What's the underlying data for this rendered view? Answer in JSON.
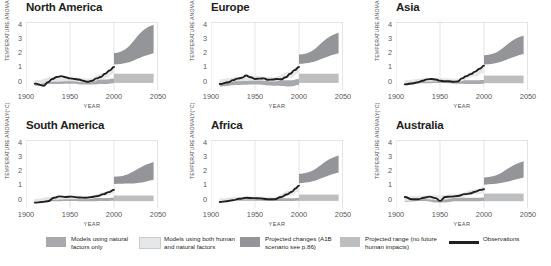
{
  "figure": {
    "ylabel": "TEMPERATURE ANOMALY(°C)",
    "xlabel": "YEAR",
    "yticks": [
      "4",
      "3",
      "2",
      "1",
      "0"
    ],
    "xticks": [
      "1900",
      "1950",
      "2000",
      "2050"
    ]
  },
  "colors": {
    "natural_band": "#a7a9ac",
    "human_natural_band": "#e6e7e8",
    "projected_changes": "#939598",
    "projected_range": "#bcbec0",
    "observations": "#231f20",
    "axis": "#d9d9d9",
    "tick_text": "#58595b"
  },
  "legend": {
    "items": [
      {
        "name": "natural-only",
        "type": "swatch",
        "color": "#a7a9ac",
        "label": "Models using natural factors only"
      },
      {
        "name": "human-and-natural",
        "type": "swatch",
        "color": "#e6e7e8",
        "label": "Models using both human and natural factors"
      },
      {
        "name": "projected-changes",
        "type": "swatch",
        "color": "#939598",
        "label": "Projected changes (A1B scenario see p.86)"
      },
      {
        "name": "projected-range",
        "type": "swatch",
        "color": "#bcbec0",
        "label": "Projected range (no future human impacts)"
      },
      {
        "name": "observations",
        "type": "line",
        "color": "#231f20",
        "label": "Observations"
      }
    ]
  },
  "chart_data": {
    "type": "line",
    "xlabel": "YEAR",
    "ylabel": "TEMPERATURE ANOMALY(°C)",
    "xlim": [
      1900,
      2050
    ],
    "ylim": [
      -0.6,
      4.2
    ],
    "grid": false,
    "legend_position": "bottom",
    "panels": [
      {
        "name": "north-america",
        "title": "North America",
        "observations": {
          "x": [
            1910,
            1920,
            1925,
            1930,
            1935,
            1940,
            1945,
            1950,
            1955,
            1960,
            1965,
            1970,
            1975,
            1980,
            1985,
            1990,
            1995,
            2000
          ],
          "y": [
            -0.15,
            -0.3,
            -0.05,
            0.18,
            0.32,
            0.38,
            0.3,
            0.22,
            0.18,
            0.14,
            0.05,
            -0.02,
            0.05,
            0.22,
            0.32,
            0.55,
            0.78,
            1.02
          ]
        },
        "human_natural_band": {
          "x": [
            1910,
            1930,
            1950,
            1970,
            1990,
            2000
          ],
          "lower": [
            -0.22,
            -0.02,
            0.02,
            -0.08,
            0.22,
            0.55
          ],
          "upper": [
            0.08,
            0.3,
            0.32,
            0.22,
            0.62,
            1.05
          ]
        },
        "natural_band": {
          "x": [
            1910,
            1930,
            1950,
            1970,
            1990,
            2000
          ],
          "lower": [
            -0.3,
            -0.18,
            -0.15,
            -0.22,
            -0.18,
            -0.12
          ],
          "upper": [
            0.05,
            0.18,
            0.18,
            0.1,
            0.15,
            0.22
          ]
        },
        "projected_changes": {
          "x": [
            2000,
            2045
          ],
          "lower": [
            1.2,
            2.0
          ],
          "upper": [
            2.0,
            4.0
          ]
        },
        "projected_range": {
          "x": [
            2000,
            2045
          ],
          "lower": [
            -0.1,
            -0.1
          ],
          "upper": [
            0.55,
            0.55
          ]
        }
      },
      {
        "name": "europe",
        "title": "Europe",
        "observations": {
          "x": [
            1910,
            1920,
            1925,
            1930,
            1935,
            1940,
            1945,
            1950,
            1955,
            1960,
            1965,
            1970,
            1975,
            1980,
            1985,
            1990,
            1995,
            2000
          ],
          "y": [
            -0.18,
            -0.05,
            0.1,
            0.2,
            0.26,
            0.42,
            0.3,
            0.18,
            0.2,
            0.22,
            0.12,
            0.14,
            0.18,
            0.16,
            0.3,
            0.55,
            0.8,
            1.02
          ]
        },
        "human_natural_band": {
          "x": [
            1910,
            1930,
            1950,
            1970,
            1990,
            2000
          ],
          "lower": [
            -0.15,
            0.02,
            0.05,
            0.0,
            0.25,
            0.58
          ],
          "upper": [
            0.18,
            0.32,
            0.38,
            0.3,
            0.68,
            1.08
          ]
        },
        "natural_band": {
          "x": [
            1910,
            1930,
            1950,
            1970,
            1990,
            2000
          ],
          "lower": [
            -0.35,
            -0.25,
            -0.22,
            -0.3,
            -0.35,
            -0.25
          ],
          "upper": [
            0.05,
            0.18,
            0.2,
            0.12,
            0.08,
            0.18
          ]
        },
        "projected_changes": {
          "x": [
            2000,
            2045
          ],
          "lower": [
            1.25,
            2.0
          ],
          "upper": [
            1.9,
            3.45
          ]
        },
        "projected_range": {
          "x": [
            2000,
            2045
          ],
          "lower": [
            -0.1,
            -0.1
          ],
          "upper": [
            0.55,
            0.55
          ]
        }
      },
      {
        "name": "asia",
        "title": "Asia",
        "observations": {
          "x": [
            1910,
            1920,
            1925,
            1930,
            1935,
            1940,
            1945,
            1950,
            1955,
            1960,
            1965,
            1970,
            1975,
            1980,
            1985,
            1990,
            1995,
            2000
          ],
          "y": [
            -0.2,
            -0.12,
            -0.05,
            0.05,
            0.15,
            0.18,
            0.14,
            0.05,
            0.02,
            0.02,
            -0.02,
            0.0,
            0.22,
            0.38,
            0.52,
            0.7,
            0.9,
            1.12
          ]
        },
        "human_natural_band": {
          "x": [
            1910,
            1930,
            1950,
            1970,
            1990,
            2000
          ],
          "lower": [
            -0.18,
            -0.02,
            0.0,
            -0.02,
            0.35,
            0.62
          ],
          "upper": [
            0.1,
            0.22,
            0.25,
            0.2,
            0.75,
            1.15
          ]
        },
        "natural_band": {
          "x": [
            1910,
            1930,
            1950,
            1970,
            1990,
            2000
          ],
          "lower": [
            -0.25,
            -0.12,
            -0.1,
            -0.15,
            -0.18,
            -0.15
          ],
          "upper": [
            0.02,
            0.12,
            0.12,
            0.08,
            0.08,
            0.1
          ]
        },
        "projected_changes": {
          "x": [
            2000,
            2045
          ],
          "lower": [
            1.2,
            1.95
          ],
          "upper": [
            1.85,
            3.25
          ]
        },
        "projected_range": {
          "x": [
            2000,
            2045
          ],
          "lower": [
            -0.12,
            -0.12
          ],
          "upper": [
            0.42,
            0.42
          ]
        }
      },
      {
        "name": "south-america",
        "title": "South America",
        "observations": {
          "x": [
            1910,
            1918,
            1925,
            1932,
            1938,
            1945,
            1952,
            1960,
            1968,
            1975,
            1982,
            1988,
            1994,
            2000
          ],
          "y": [
            -0.22,
            -0.18,
            -0.12,
            0.12,
            0.22,
            0.18,
            0.2,
            0.14,
            0.12,
            0.18,
            0.25,
            0.38,
            0.52,
            0.68
          ]
        },
        "human_natural_band": {
          "x": [
            1910,
            1930,
            1950,
            1970,
            1990,
            2000
          ],
          "lower": [
            -0.2,
            -0.02,
            0.02,
            0.02,
            0.25,
            0.42
          ],
          "upper": [
            0.05,
            0.22,
            0.28,
            0.25,
            0.52,
            0.75
          ]
        },
        "natural_band": {
          "x": [
            1910,
            1930,
            1950,
            1970,
            1990,
            2000
          ],
          "lower": [
            -0.22,
            -0.12,
            -0.1,
            -0.12,
            -0.1,
            -0.08
          ],
          "upper": [
            0.02,
            0.1,
            0.12,
            0.1,
            0.1,
            0.12
          ]
        },
        "projected_changes": {
          "x": [
            2000,
            2045
          ],
          "lower": [
            1.1,
            1.4
          ],
          "upper": [
            1.6,
            2.65
          ]
        },
        "projected_range": {
          "x": [
            2000,
            2045
          ],
          "lower": [
            -0.12,
            -0.12
          ],
          "upper": [
            0.28,
            0.28
          ]
        }
      },
      {
        "name": "africa",
        "title": "Africa",
        "observations": {
          "x": [
            1910,
            1918,
            1925,
            1932,
            1940,
            1948,
            1956,
            1964,
            1972,
            1980,
            1986,
            1992,
            1996,
            2000
          ],
          "y": [
            -0.18,
            -0.12,
            -0.05,
            0.05,
            0.12,
            0.1,
            0.08,
            0.02,
            0.02,
            0.18,
            0.35,
            0.55,
            0.78,
            0.98
          ]
        },
        "human_natural_band": {
          "x": [
            1910,
            1930,
            1950,
            1970,
            1990,
            2000
          ],
          "lower": [
            -0.15,
            0.0,
            0.02,
            0.0,
            0.3,
            0.55
          ],
          "upper": [
            0.08,
            0.2,
            0.22,
            0.18,
            0.62,
            1.0
          ]
        },
        "natural_band": {
          "x": [
            1910,
            1930,
            1950,
            1970,
            1990,
            2000
          ],
          "lower": [
            -0.18,
            -0.08,
            -0.08,
            -0.1,
            -0.1,
            -0.08
          ],
          "upper": [
            0.02,
            0.1,
            0.1,
            0.08,
            0.08,
            0.1
          ]
        },
        "projected_changes": {
          "x": [
            2000,
            2045
          ],
          "lower": [
            1.15,
            1.9
          ],
          "upper": [
            1.8,
            3.1
          ]
        },
        "projected_range": {
          "x": [
            2000,
            2045
          ],
          "lower": [
            -0.1,
            -0.1
          ],
          "upper": [
            0.35,
            0.35
          ]
        }
      },
      {
        "name": "australia",
        "title": "Australia",
        "observations": {
          "x": [
            1910,
            1918,
            1925,
            1932,
            1938,
            1945,
            1950,
            1956,
            1962,
            1970,
            1978,
            1984,
            1990,
            1996,
            2000
          ],
          "y": [
            0.18,
            0.02,
            0.02,
            0.12,
            0.2,
            0.1,
            -0.1,
            0.18,
            0.2,
            0.25,
            0.38,
            0.42,
            0.55,
            0.68,
            0.72
          ]
        },
        "human_natural_band": {
          "x": [
            1910,
            1930,
            1950,
            1970,
            1990,
            2000
          ],
          "lower": [
            -0.1,
            0.02,
            -0.05,
            0.1,
            0.35,
            0.45
          ],
          "upper": [
            0.22,
            0.28,
            0.3,
            0.4,
            0.72,
            0.88
          ]
        },
        "natural_band": {
          "x": [
            1910,
            1930,
            1950,
            1970,
            1990,
            2000
          ],
          "lower": [
            -0.15,
            -0.1,
            -0.22,
            -0.12,
            -0.12,
            -0.1
          ],
          "upper": [
            0.1,
            0.15,
            0.1,
            0.15,
            0.12,
            0.15
          ]
        },
        "projected_changes": {
          "x": [
            2000,
            2045
          ],
          "lower": [
            1.05,
            1.55
          ],
          "upper": [
            1.55,
            2.7
          ]
        },
        "projected_range": {
          "x": [
            2000,
            2045
          ],
          "lower": [
            -0.12,
            -0.12
          ],
          "upper": [
            0.42,
            0.42
          ]
        }
      }
    ]
  }
}
